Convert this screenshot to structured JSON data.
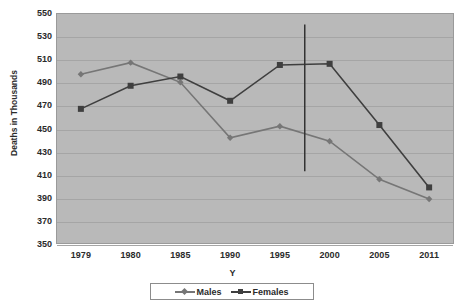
{
  "chart_data": {
    "type": "line",
    "title": "",
    "xlabel": "Y",
    "ylabel": "Deaths in Thousands",
    "categories": [
      "1979",
      "1980",
      "1985",
      "1990",
      "1995",
      "2000",
      "2005",
      "2011"
    ],
    "ylim": [
      350,
      550
    ],
    "ytick_values": [
      550,
      530,
      510,
      490,
      470,
      450,
      430,
      410,
      390,
      370,
      350
    ],
    "ytick_labels": [
      "550",
      "530",
      "510",
      "490",
      "470",
      "450",
      "430",
      "410",
      "390",
      "370",
      "350"
    ],
    "grid": true,
    "legend_position": "bottom",
    "series": [
      {
        "name": "Males",
        "marker": "diamond",
        "color": "#767676",
        "values": [
          497,
          507,
          490,
          442,
          452,
          439,
          406,
          389
        ]
      },
      {
        "name": "Females",
        "marker": "square",
        "color": "#3f3f3f",
        "values": [
          467,
          487,
          495,
          474,
          505,
          506,
          453,
          399
        ]
      }
    ],
    "annotations": [
      {
        "type": "vertical-line",
        "label": "reference-line",
        "x_between": [
          "1995",
          "2000"
        ],
        "x_value": 1998,
        "y_top": 540,
        "y_bottom": 413,
        "color": "#333333"
      }
    ]
  },
  "legend": {
    "items": [
      {
        "label": "Males",
        "marker": "diamond",
        "color": "#767676"
      },
      {
        "label": "Females",
        "marker": "square",
        "color": "#3f3f3f"
      }
    ]
  },
  "colors": {
    "plot_background": "#b9b9b9",
    "gridline": "#a5a5a5",
    "axis_text": "#2b2b2b",
    "page_background": "#ffffff",
    "males_series": "#767676",
    "females_series": "#3f3f3f",
    "reference_line": "#333333"
  }
}
